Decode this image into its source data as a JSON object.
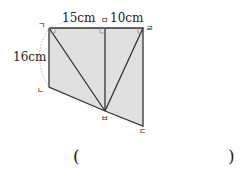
{
  "figure": {
    "dimension_labels": {
      "top_left_segment": "15cm",
      "top_right_segment": "10cm",
      "left_side": "16cm"
    },
    "vertex_labels": {
      "top_left": "ㄱ",
      "top_middle": "ㅁ",
      "top_right": "ㄹ",
      "bottom_left": "ㄴ",
      "bottom_middle": "ㅂ",
      "bottom_right": "ㄷ"
    },
    "colors": {
      "fill": "#e0e0e0",
      "stroke": "#333333",
      "arc": "#aaaaaa"
    }
  },
  "answer": {
    "open_paren": "(",
    "close_paren": ")",
    "value": ""
  }
}
